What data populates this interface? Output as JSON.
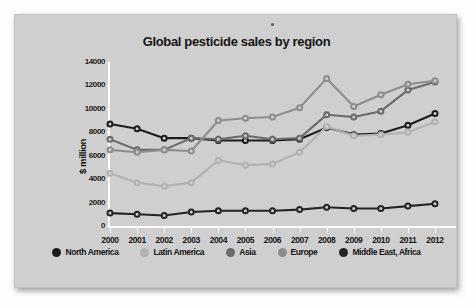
{
  "panel": {
    "background_color": "#cfcfcf"
  },
  "chart_data": {
    "type": "line",
    "title": "Global pesticide sales by region",
    "xlabel": "",
    "ylabel": "$ million",
    "ylim": [
      0,
      14000
    ],
    "yticks": [
      0,
      2000,
      4000,
      6000,
      8000,
      10000,
      12000,
      14000
    ],
    "ytick_labels": [
      "0",
      "2000",
      "4000",
      "6000",
      "8000",
      "10000",
      "12000",
      "14000"
    ],
    "grid": false,
    "legend_position": "bottom",
    "categories": [
      "2000",
      "2001",
      "2002",
      "2003",
      "2004",
      "2005",
      "2006",
      "2007",
      "2008",
      "2009",
      "2010",
      "2011",
      "2012"
    ],
    "x": [
      2000,
      2001,
      2002,
      2003,
      2004,
      2005,
      2006,
      2007,
      2008,
      2009,
      2010,
      2011,
      2012
    ],
    "series": [
      {
        "name": "North America",
        "color": "#1c1c1c",
        "values": [
          8700,
          8300,
          7500,
          7500,
          7300,
          7300,
          7300,
          7400,
          8400,
          7800,
          7900,
          8600,
          9600
        ]
      },
      {
        "name": "Latin America",
        "color": "#b2b2b2",
        "values": [
          4500,
          3700,
          3400,
          3700,
          5600,
          5200,
          5300,
          6300,
          8500,
          7700,
          7800,
          8000,
          8900
        ]
      },
      {
        "name": "Asia",
        "color": "#6a6a6a",
        "values": [
          7400,
          6500,
          6500,
          7500,
          7400,
          7700,
          7400,
          7500,
          9500,
          9300,
          9800,
          11600,
          12300
        ]
      },
      {
        "name": "Europe",
        "color": "#8d8d8d",
        "values": [
          6500,
          6300,
          6500,
          6400,
          9000,
          9200,
          9300,
          10100,
          12600,
          10200,
          11200,
          12100,
          12400
        ]
      },
      {
        "name": "Middle East, Africa",
        "color": "#242424",
        "values": [
          1100,
          1000,
          900,
          1200,
          1300,
          1300,
          1300,
          1400,
          1600,
          1500,
          1500,
          1700,
          1900
        ]
      }
    ]
  },
  "legend": {
    "items": [
      {
        "label": "North America",
        "color": "#1c1c1c"
      },
      {
        "label": "Latin America",
        "color": "#b2b2b2"
      },
      {
        "label": "Asia",
        "color": "#6a6a6a"
      },
      {
        "label": "Europe",
        "color": "#8d8d8d"
      },
      {
        "label": "Middle East, Africa",
        "color": "#242424"
      }
    ]
  }
}
